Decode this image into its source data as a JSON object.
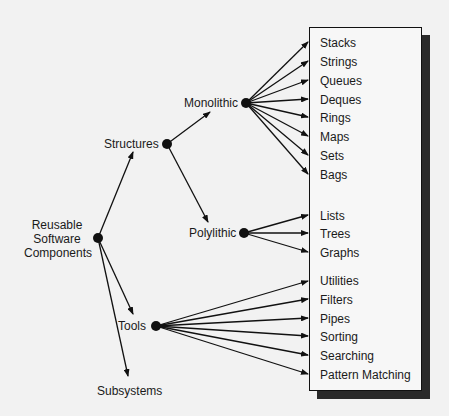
{
  "diagram": {
    "root": {
      "label_lines": [
        "Reusable",
        "Software",
        "Components"
      ]
    },
    "branches": {
      "structures": "Structures",
      "monolithic": "Monolithic",
      "polylithic": "Polylithic",
      "tools": "Tools",
      "subsystems": "Subsystems"
    },
    "monolithic_items": [
      "Stacks",
      "Strings",
      "Queues",
      "Deques",
      "Rings",
      "Maps",
      "Sets",
      "Bags"
    ],
    "polylithic_items": [
      "Lists",
      "Trees",
      "Graphs"
    ],
    "tools_items": [
      "Utilities",
      "Filters",
      "Pipes",
      "Sorting",
      "Searching",
      "Pattern Matching"
    ],
    "colors": {
      "line": "#111111",
      "box_bg": "#f7f7f7",
      "shadow": "#2a2a2a",
      "background": "#f2f2f2"
    }
  }
}
